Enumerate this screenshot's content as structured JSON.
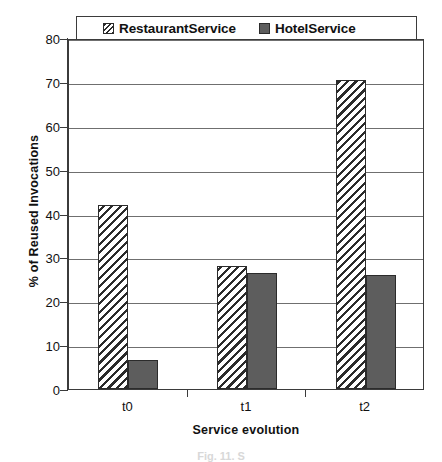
{
  "chart_data": {
    "type": "bar",
    "title": "",
    "xlabel": "Service evolution",
    "ylabel": "% of Reused Invocations",
    "categories": [
      "t0",
      "t1",
      "t2"
    ],
    "ylim": [
      0,
      80
    ],
    "yticks": [
      0,
      10,
      20,
      30,
      40,
      50,
      60,
      70,
      80
    ],
    "ytick_labels": [
      "0",
      "10",
      "20",
      "30",
      "40",
      "50",
      "60",
      "70",
      "80"
    ],
    "grid": true,
    "legend_position": "top",
    "series": [
      {
        "name": "RestaurantService",
        "pattern": "diagonal-hatch",
        "color": "#ffffff",
        "edge_color": "#2b2b2b",
        "values": [
          42,
          28,
          70.5
        ]
      },
      {
        "name": "HotelService",
        "pattern": "solid",
        "color": "#5d5d5d",
        "edge_color": "#2b2b2b",
        "values": [
          6.5,
          26.5,
          26
        ]
      }
    ]
  },
  "legend": {
    "items": [
      {
        "label": "RestaurantService",
        "swatch": "hatched-swatch"
      },
      {
        "label": "HotelService",
        "swatch": "solid-swatch"
      }
    ]
  },
  "caption": {
    "text": "Fig. 11. S"
  }
}
